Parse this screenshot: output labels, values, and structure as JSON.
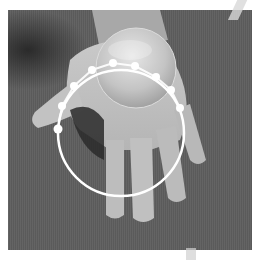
{
  "image": {
    "description": "Grayscale photo of an open hand holding a glass sphere, with a white circular overlay and a chain of white dots",
    "background_color": "#5e5e5e",
    "overlay_color": "#ffffff",
    "photo_bounds": {
      "x": 8,
      "y": 10,
      "width": 244,
      "height": 240
    }
  },
  "overlay": {
    "circle": {
      "cx": 121,
      "cy": 133,
      "r": 63,
      "stroke_width": 2.5
    },
    "sphere": {
      "cx": 136,
      "cy": 68,
      "r": 40
    },
    "dots": [
      {
        "x": 58,
        "y": 129,
        "r": 4.5
      },
      {
        "x": 62,
        "y": 106,
        "r": 4
      },
      {
        "x": 74,
        "y": 86,
        "r": 4
      },
      {
        "x": 92,
        "y": 70,
        "r": 4
      },
      {
        "x": 113,
        "y": 63,
        "r": 4
      },
      {
        "x": 135,
        "y": 66,
        "r": 4
      },
      {
        "x": 156,
        "y": 77,
        "r": 4
      },
      {
        "x": 171,
        "y": 90,
        "r": 4
      },
      {
        "x": 180,
        "y": 108,
        "r": 4
      }
    ]
  }
}
